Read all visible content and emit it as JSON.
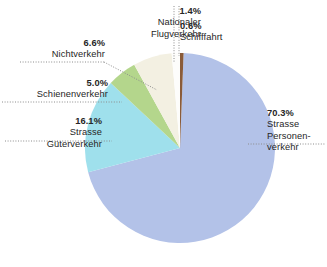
{
  "chart_data": {
    "type": "pie",
    "title": "",
    "subtitle": "",
    "xlabel": "",
    "ylabel": "",
    "unit": "%",
    "legend_position": "callout-labels",
    "grid": false,
    "total": 100.0,
    "categories": [
      "Schifffahrt",
      "Strasse Personenverkehr",
      "Strasse Güterverkehr",
      "Schienenverkehr",
      "Nichtverkehr",
      "Nationaler Flugverkehr"
    ],
    "values": [
      0.6,
      70.3,
      16.1,
      5.0,
      6.6,
      1.4
    ],
    "colors": [
      "#8a5b39",
      "#b3c2e8",
      "#9fe0ec",
      "#b4d68c",
      "#f3f0e2",
      "#fdfdfb"
    ],
    "slices": [
      {
        "key": "schifffahrt",
        "label": "Schifffahrt",
        "value": 0.6,
        "percent_text": "0.6%",
        "color": "#8a5b39",
        "name_lines": [
          "Schifffahrt"
        ]
      },
      {
        "key": "strasse-personenverkehr",
        "label": "Strasse Personenverkehr",
        "value": 70.3,
        "percent_text": "70.3%",
        "color": "#b3c2e8",
        "name_lines": [
          "Strasse",
          "Personen-",
          "verkehr"
        ]
      },
      {
        "key": "strasse-gueterverkehr",
        "label": "Strasse Güterverkehr",
        "value": 16.1,
        "percent_text": "16.1%",
        "color": "#9fe0ec",
        "name_lines": [
          "Strasse",
          "Güterverkehr"
        ]
      },
      {
        "key": "schienenverkehr",
        "label": "Schienenverkehr",
        "value": 5.0,
        "percent_text": "5.0%",
        "color": "#b4d68c",
        "name_lines": [
          "Schienenverkehr"
        ]
      },
      {
        "key": "nichtverkehr",
        "label": "Nichtverkehr",
        "value": 6.6,
        "percent_text": "6.6%",
        "color": "#f3f0e2",
        "name_lines": [
          "Nichtverkehr"
        ]
      },
      {
        "key": "nationaler-flugverkehr",
        "label": "Nationaler Flugverkehr",
        "value": 1.4,
        "percent_text": "1.4%",
        "color": "#fdfdfb",
        "name_lines": [
          "Nationaler",
          "Flugverkehr"
        ]
      }
    ]
  },
  "labels": {
    "personenverkehr": {
      "percent": "70.3%",
      "line1": "Strasse",
      "line2": "Personen-",
      "line3": "verkehr"
    },
    "gueterverkehr": {
      "percent": "16.1%",
      "line1": "Strasse",
      "line2": "Güterverkehr"
    },
    "schienenverkehr": {
      "percent": "5.0%",
      "line1": "Schienenverkehr"
    },
    "nichtverkehr": {
      "percent": "6.6%",
      "line1": "Nichtverkehr"
    },
    "flugverkehr": {
      "percent": "1.4%",
      "line1": "Nationaler",
      "line2": "Flugverkehr"
    },
    "schifffahrt": {
      "percent": "0.6%",
      "line1": "Schifffahrt"
    }
  },
  "style": {
    "background": "#ffffff",
    "text_color": "#262626",
    "leader_color": "#8c8c8c"
  }
}
